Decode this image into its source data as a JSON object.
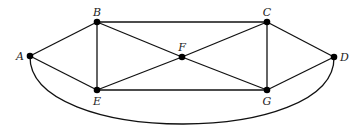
{
  "diagram": {
    "type": "graph",
    "directed": false,
    "colors": {
      "edge": "#111111",
      "node": "#000000",
      "label": "#222222",
      "background": "#ffffff"
    },
    "nodes": [
      {
        "id": "A",
        "label": "A",
        "x": 30,
        "y": 56,
        "label_pos": "left"
      },
      {
        "id": "B",
        "label": "B",
        "x": 97,
        "y": 22,
        "label_pos": "above"
      },
      {
        "id": "C",
        "label": "C",
        "x": 267,
        "y": 22,
        "label_pos": "above"
      },
      {
        "id": "D",
        "label": "D",
        "x": 334,
        "y": 57,
        "label_pos": "right"
      },
      {
        "id": "E",
        "label": "E",
        "x": 97,
        "y": 90,
        "label_pos": "below"
      },
      {
        "id": "F",
        "label": "F",
        "x": 182,
        "y": 57,
        "label_pos": "above"
      },
      {
        "id": "G",
        "label": "G",
        "x": 267,
        "y": 90,
        "label_pos": "below"
      }
    ],
    "edges": [
      {
        "from": "A",
        "to": "B",
        "shape": "straight"
      },
      {
        "from": "A",
        "to": "E",
        "shape": "straight"
      },
      {
        "from": "B",
        "to": "C",
        "shape": "straight"
      },
      {
        "from": "B",
        "to": "E",
        "shape": "straight"
      },
      {
        "from": "B",
        "to": "F",
        "shape": "straight"
      },
      {
        "from": "C",
        "to": "F",
        "shape": "straight"
      },
      {
        "from": "C",
        "to": "G",
        "shape": "straight"
      },
      {
        "from": "C",
        "to": "D",
        "shape": "straight"
      },
      {
        "from": "E",
        "to": "F",
        "shape": "straight"
      },
      {
        "from": "E",
        "to": "G",
        "shape": "straight"
      },
      {
        "from": "F",
        "to": "G",
        "shape": "straight"
      },
      {
        "from": "G",
        "to": "D",
        "shape": "straight"
      },
      {
        "from": "A",
        "to": "D",
        "shape": "curve-below"
      }
    ]
  }
}
